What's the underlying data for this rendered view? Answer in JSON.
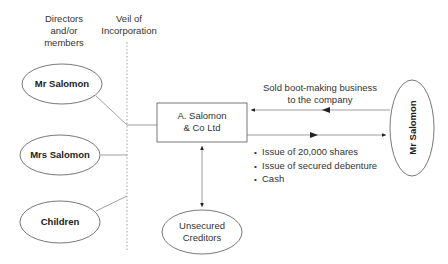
{
  "diagram": {
    "headers": {
      "members": "Directors\nand/or\nmembers",
      "members_lines": [
        "Directors",
        "and/or",
        "members"
      ],
      "veil_lines": [
        "Veil of",
        "Incorporation"
      ]
    },
    "left_nodes": [
      {
        "label": "Mr Salomon"
      },
      {
        "label": "Mrs Salomon"
      },
      {
        "label": "Children"
      }
    ],
    "company": {
      "lines": [
        "A. Salomon",
        "& Co Ltd"
      ]
    },
    "creditors": {
      "lines": [
        "Unsecured",
        "Creditors"
      ]
    },
    "right_node": {
      "label": "Mr Salomon"
    },
    "transfer_to_company": {
      "lines": [
        "Sold boot-making business",
        "to the company"
      ]
    },
    "consideration": {
      "items": [
        "Issue of 20,000 shares",
        "Issue of secured debenture",
        "Cash"
      ]
    },
    "colors": {
      "line": "#555555",
      "text": "#2a2a2a",
      "background": "#ffffff"
    }
  }
}
